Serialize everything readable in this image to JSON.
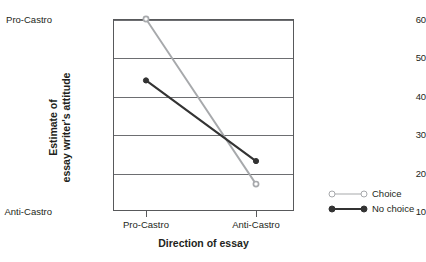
{
  "chart_data": {
    "type": "line",
    "title": "",
    "xlabel": "Direction of essay",
    "ylabel": "Estimate of\nessay writer's attitude",
    "ylabel_line1": "Estimate of",
    "ylabel_line2": "essay writer's attitude",
    "categories": [
      "Pro-Castro",
      "Anti-Castro"
    ],
    "ylim": [
      10,
      60
    ],
    "yticks": [
      10,
      20,
      30,
      40,
      50,
      60
    ],
    "ytick_labels": [
      "10",
      "20",
      "30",
      "40",
      "50",
      "60"
    ],
    "y_axis_endpoint_labels": {
      "top": "Pro-Castro",
      "bottom": "Anti-Castro"
    },
    "grid": true,
    "legend_position": "right",
    "series": [
      {
        "name": "Choice",
        "color": "#a7a9ac",
        "marker": "circle-open",
        "values": [
          60,
          17
        ]
      },
      {
        "name": "No choice",
        "color": "#333333",
        "marker": "circle-filled",
        "values": [
          44,
          23
        ]
      }
    ]
  },
  "axes": {
    "y_top_label": "Pro-Castro",
    "y_bottom_label": "Anti-Castro",
    "y_title_line1": "Estimate of",
    "y_title_line2": "essay writer's attitude",
    "x_title": "Direction of essay",
    "x_tick_1": "Pro-Castro",
    "x_tick_2": "Anti-Castro",
    "ytick_60": "60",
    "ytick_50": "50",
    "ytick_40": "40",
    "ytick_30": "30",
    "ytick_20": "20",
    "ytick_10": "10"
  },
  "legend": {
    "items": [
      {
        "label": "Choice",
        "color": "#a7a9ac"
      },
      {
        "label": "No choice",
        "color": "#333333"
      }
    ]
  }
}
